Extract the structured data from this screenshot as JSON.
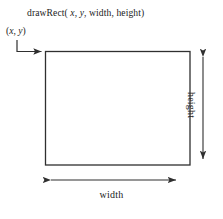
{
  "figure": {
    "signature": {
      "prefix": "drawRect( ",
      "arg_x": "x",
      "sep1": ", ",
      "arg_y": "y",
      "sep2": ", ",
      "arg_width": "width",
      "sep3": ", ",
      "arg_height": "height",
      "suffix": ")",
      "full_text": "drawRect( x, y, width, height)"
    },
    "origin_label": {
      "open_paren": "(",
      "x": "x",
      "comma": ", ",
      "y": "y",
      "close_paren": ")",
      "full_text": "(x, y)"
    },
    "width_label": "width",
    "height_label": "height",
    "colors": {
      "background": "#ffffff",
      "stroke": "#3a3a3a",
      "rect_stroke": "#2f2f2f",
      "text": "#1b1b1b"
    },
    "geometry": {
      "rect_left": 45,
      "rect_top": 51,
      "rect_right": 190,
      "rect_bottom": 165,
      "width_arrow_y": 180,
      "height_arrow_x": 203,
      "origin_elbow_x": 17,
      "origin_elbow_y": 40
    }
  }
}
